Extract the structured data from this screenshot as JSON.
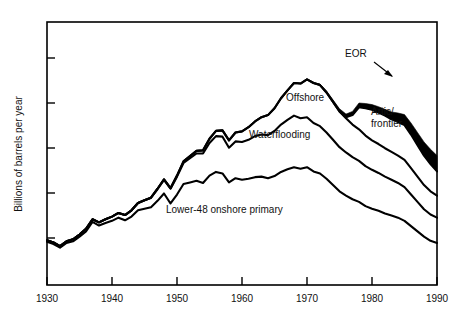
{
  "figure": {
    "background_color": "#ffffff",
    "ink_color": "#000000"
  },
  "axes": {
    "y_title": "Billions of barrels per year",
    "x_ticks": [
      "1930",
      "1940",
      "1950",
      "1960",
      "1970",
      "1980",
      "1990"
    ],
    "y_ticks": [
      "",
      "",
      "",
      "",
      ""
    ]
  },
  "labels": {
    "eor": "EOR",
    "offshore": "Offshore",
    "arctic": "Artic/",
    "arctic2": "frontier",
    "waterflooding": "Waterflooding",
    "lower48": "Lower-48 onshore primary"
  },
  "chart_data": {
    "type": "area",
    "title": "",
    "subtitle": "",
    "xlabel": "",
    "ylabel": "Billions of barrels per year",
    "xlim": [
      1930,
      1990
    ],
    "ylim": [
      0,
      5
    ],
    "grid": false,
    "legend": "inline-annotations",
    "stacked": true,
    "annotations": [
      {
        "text": "EOR",
        "x": 1980,
        "y": 4.35,
        "leader_to_x": 1982.6,
        "leader_to_y": 3.62
      },
      {
        "text": "Offshore",
        "x": 1971.5,
        "y": 3.34
      },
      {
        "text": "Artic/ frontier",
        "x": 1982.5,
        "y": 2.95
      },
      {
        "text": "Waterflooding",
        "x": 1967.0,
        "y": 2.5
      },
      {
        "text": "Lower-48 onshore primary",
        "x": 1957.5,
        "y": 1.46
      }
    ],
    "x": [
      1930,
      1931,
      1932,
      1933,
      1934,
      1935,
      1936,
      1937,
      1938,
      1939,
      1940,
      1941,
      1942,
      1943,
      1944,
      1945,
      1946,
      1947,
      1948,
      1949,
      1950,
      1951,
      1952,
      1953,
      1954,
      1955,
      1956,
      1957,
      1958,
      1959,
      1960,
      1961,
      1962,
      1963,
      1964,
      1965,
      1966,
      1967,
      1968,
      1969,
      1970,
      1971,
      1972,
      1973,
      1974,
      1975,
      1976,
      1977,
      1978,
      1979,
      1980,
      1981,
      1982,
      1983,
      1984,
      1985,
      1986,
      1987,
      1988,
      1989,
      1990
    ],
    "series": [
      {
        "name": "Lower-48 onshore primary",
        "values": [
          0.82,
          0.78,
          0.71,
          0.8,
          0.83,
          0.92,
          1.02,
          1.2,
          1.13,
          1.18,
          1.22,
          1.28,
          1.23,
          1.3,
          1.42,
          1.45,
          1.48,
          1.6,
          1.74,
          1.55,
          1.72,
          1.92,
          1.95,
          1.98,
          1.94,
          2.08,
          2.15,
          2.12,
          1.95,
          2.03,
          2.0,
          2.02,
          2.05,
          2.06,
          2.03,
          2.07,
          2.15,
          2.2,
          2.24,
          2.21,
          2.24,
          2.16,
          2.12,
          2.02,
          1.9,
          1.78,
          1.7,
          1.63,
          1.58,
          1.5,
          1.45,
          1.41,
          1.36,
          1.32,
          1.28,
          1.22,
          1.12,
          1.02,
          0.92,
          0.84,
          0.8
        ]
      },
      {
        "name": "Waterflooding",
        "values": [
          0.03,
          0.03,
          0.03,
          0.03,
          0.04,
          0.04,
          0.05,
          0.05,
          0.06,
          0.07,
          0.08,
          0.09,
          0.1,
          0.12,
          0.14,
          0.16,
          0.18,
          0.22,
          0.26,
          0.28,
          0.34,
          0.4,
          0.46,
          0.52,
          0.56,
          0.62,
          0.68,
          0.7,
          0.66,
          0.7,
          0.72,
          0.74,
          0.78,
          0.8,
          0.82,
          0.86,
          0.9,
          0.94,
          0.98,
          0.96,
          0.95,
          0.92,
          0.9,
          0.88,
          0.86,
          0.84,
          0.82,
          0.8,
          0.78,
          0.76,
          0.74,
          0.72,
          0.7,
          0.68,
          0.66,
          0.64,
          0.6,
          0.56,
          0.52,
          0.5,
          0.48
        ]
      },
      {
        "name": "Offshore",
        "values": [
          0.0,
          0.0,
          0.0,
          0.0,
          0.0,
          0.0,
          0.0,
          0.0,
          0.0,
          0.0,
          0.0,
          0.0,
          0.0,
          0.0,
          0.0,
          0.0,
          0.0,
          0.01,
          0.01,
          0.01,
          0.02,
          0.03,
          0.04,
          0.05,
          0.06,
          0.08,
          0.1,
          0.12,
          0.14,
          0.17,
          0.2,
          0.24,
          0.28,
          0.33,
          0.38,
          0.43,
          0.5,
          0.56,
          0.62,
          0.66,
          0.72,
          0.76,
          0.78,
          0.76,
          0.72,
          0.68,
          0.65,
          0.62,
          0.6,
          0.58,
          0.56,
          0.55,
          0.54,
          0.53,
          0.52,
          0.52,
          0.5,
          0.48,
          0.46,
          0.44,
          0.42
        ]
      },
      {
        "name": "Artic/frontier",
        "values": [
          0.0,
          0.0,
          0.0,
          0.0,
          0.0,
          0.0,
          0.0,
          0.0,
          0.0,
          0.0,
          0.0,
          0.0,
          0.0,
          0.0,
          0.0,
          0.0,
          0.0,
          0.0,
          0.0,
          0.0,
          0.0,
          0.0,
          0.0,
          0.0,
          0.0,
          0.0,
          0.0,
          0.0,
          0.0,
          0.0,
          0.0,
          0.0,
          0.0,
          0.0,
          0.0,
          0.0,
          0.0,
          0.0,
          0.0,
          0.0,
          0.0,
          0.0,
          0.0,
          0.0,
          0.0,
          0.0,
          0.02,
          0.18,
          0.42,
          0.52,
          0.58,
          0.6,
          0.62,
          0.62,
          0.64,
          0.66,
          0.64,
          0.6,
          0.56,
          0.52,
          0.46
        ]
      },
      {
        "name": "EOR",
        "values": [
          0.0,
          0.0,
          0.0,
          0.0,
          0.0,
          0.0,
          0.0,
          0.0,
          0.0,
          0.0,
          0.0,
          0.0,
          0.0,
          0.0,
          0.0,
          0.0,
          0.0,
          0.0,
          0.0,
          0.0,
          0.0,
          0.0,
          0.0,
          0.0,
          0.0,
          0.0,
          0.0,
          0.0,
          0.0,
          0.0,
          0.0,
          0.0,
          0.0,
          0.0,
          0.0,
          0.0,
          0.0,
          0.0,
          0.0,
          0.0,
          0.0,
          0.01,
          0.02,
          0.03,
          0.04,
          0.05,
          0.06,
          0.07,
          0.08,
          0.09,
          0.1,
          0.11,
          0.12,
          0.14,
          0.17,
          0.2,
          0.22,
          0.24,
          0.26,
          0.28,
          0.3
        ]
      }
    ]
  }
}
